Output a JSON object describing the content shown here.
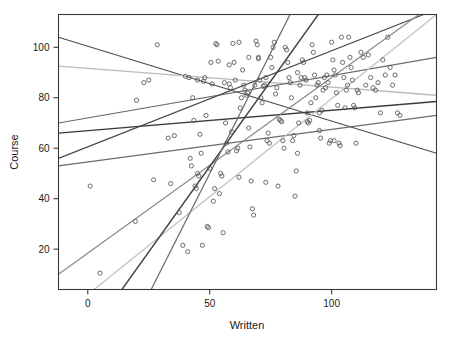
{
  "chart_data": {
    "type": "scatter",
    "title": "",
    "xlabel": "Written",
    "ylabel": "Course",
    "xlim": [
      -12,
      143
    ],
    "ylim": [
      4,
      113
    ],
    "xticks": [
      0,
      50,
      100
    ],
    "yticks": [
      20,
      40,
      60,
      80,
      100
    ],
    "xtick_labels": [
      "0",
      "50",
      "100"
    ],
    "ytick_labels": [
      "20",
      "40",
      "60",
      "80",
      "100"
    ],
    "grid": false,
    "legend": null,
    "marker": "open-circle",
    "points": [
      [
        1,
        45
      ],
      [
        5,
        10.5
      ],
      [
        19.5,
        31
      ],
      [
        20,
        79
      ],
      [
        25,
        87
      ],
      [
        27,
        47.5
      ],
      [
        28.5,
        101
      ],
      [
        34,
        46
      ],
      [
        35.5,
        65
      ],
      [
        37.5,
        34.5
      ],
      [
        39,
        21.5
      ],
      [
        40,
        88.5
      ],
      [
        41,
        19
      ],
      [
        41.5,
        88
      ],
      [
        42,
        56
      ],
      [
        42.5,
        53
      ],
      [
        43,
        80
      ],
      [
        43.5,
        71
      ],
      [
        44,
        45
      ],
      [
        44.5,
        44
      ],
      [
        45,
        50
      ],
      [
        45.5,
        49
      ],
      [
        46,
        65.5
      ],
      [
        46.5,
        58
      ],
      [
        47,
        21.5
      ],
      [
        47.5,
        86.5
      ],
      [
        48,
        88
      ],
      [
        48.5,
        73
      ],
      [
        49,
        29
      ],
      [
        49.5,
        28.5
      ],
      [
        50,
        52
      ],
      [
        50.5,
        94
      ],
      [
        51,
        85.5
      ],
      [
        51.5,
        39
      ],
      [
        52,
        44
      ],
      [
        52.5,
        101.5
      ],
      [
        53,
        101
      ],
      [
        53.5,
        94.5
      ],
      [
        54,
        42
      ],
      [
        54.5,
        50
      ],
      [
        55,
        49
      ],
      [
        55.5,
        26.5
      ],
      [
        56,
        86
      ],
      [
        56.5,
        70
      ],
      [
        57,
        62
      ],
      [
        57.5,
        58.5
      ],
      [
        58,
        85.5
      ],
      [
        58.5,
        84
      ],
      [
        59,
        66.5
      ],
      [
        59.5,
        101.5
      ],
      [
        60,
        94
      ],
      [
        60.5,
        87
      ],
      [
        61,
        59
      ],
      [
        61.5,
        60
      ],
      [
        62,
        48.5
      ],
      [
        62.5,
        76
      ],
      [
        63,
        80
      ],
      [
        63.5,
        91
      ],
      [
        64,
        85
      ],
      [
        64.5,
        83
      ],
      [
        65,
        81
      ],
      [
        65.5,
        82
      ],
      [
        66,
        68
      ],
      [
        66.5,
        60.5
      ],
      [
        67,
        47
      ],
      [
        67.5,
        36
      ],
      [
        68,
        33.5
      ],
      [
        68.5,
        85
      ],
      [
        69,
        102.5
      ],
      [
        69.5,
        101
      ],
      [
        70,
        95.5
      ],
      [
        70.5,
        87
      ],
      [
        71,
        80
      ],
      [
        71.5,
        78
      ],
      [
        72,
        84.5
      ],
      [
        72.5,
        85
      ],
      [
        73,
        46.5
      ],
      [
        73.5,
        63
      ],
      [
        74,
        66
      ],
      [
        74.5,
        62
      ],
      [
        75,
        96
      ],
      [
        75.5,
        92
      ],
      [
        76,
        100
      ],
      [
        76.5,
        102
      ],
      [
        77,
        81.5
      ],
      [
        77.5,
        84
      ],
      [
        78,
        45
      ],
      [
        78.5,
        71.5
      ],
      [
        79,
        71
      ],
      [
        79.5,
        70.5
      ],
      [
        80,
        63
      ],
      [
        80.5,
        60
      ],
      [
        81,
        100
      ],
      [
        81.5,
        99
      ],
      [
        82,
        94
      ],
      [
        82.5,
        88
      ],
      [
        83,
        86
      ],
      [
        83.5,
        80
      ],
      [
        84,
        63
      ],
      [
        84.5,
        65
      ],
      [
        85,
        41
      ],
      [
        85.5,
        51
      ],
      [
        86,
        58
      ],
      [
        86.5,
        70
      ],
      [
        87,
        85
      ],
      [
        87.5,
        88
      ],
      [
        88,
        95
      ],
      [
        88.5,
        94
      ],
      [
        89,
        88
      ],
      [
        89.5,
        87
      ],
      [
        90,
        70.5
      ],
      [
        90.5,
        70
      ],
      [
        91,
        71
      ],
      [
        91.5,
        78
      ],
      [
        92,
        101
      ],
      [
        92.5,
        98
      ],
      [
        93,
        89
      ],
      [
        93.5,
        80
      ],
      [
        94,
        85
      ],
      [
        94.5,
        86
      ],
      [
        95,
        67
      ],
      [
        95.5,
        64
      ],
      [
        96,
        75
      ],
      [
        96.5,
        83
      ],
      [
        97,
        88
      ],
      [
        97.5,
        84
      ],
      [
        98,
        89
      ],
      [
        98.5,
        86
      ],
      [
        99,
        62
      ],
      [
        99.5,
        63
      ],
      [
        100,
        102
      ],
      [
        100.5,
        95
      ],
      [
        101,
        91
      ],
      [
        101.5,
        89
      ],
      [
        102,
        82
      ],
      [
        102.5,
        77
      ],
      [
        103,
        62
      ],
      [
        103.5,
        61
      ],
      [
        104,
        104
      ],
      [
        104.5,
        94
      ],
      [
        105,
        88
      ],
      [
        105.5,
        76
      ],
      [
        106,
        83
      ],
      [
        106.5,
        85
      ],
      [
        107,
        104
      ],
      [
        107.5,
        96
      ],
      [
        108,
        92
      ],
      [
        108.5,
        87
      ],
      [
        109,
        77
      ],
      [
        109.5,
        76
      ],
      [
        110,
        62
      ],
      [
        110.5,
        83
      ],
      [
        111,
        82
      ],
      [
        112,
        98
      ],
      [
        113,
        96
      ],
      [
        114,
        85
      ],
      [
        115,
        97
      ],
      [
        116,
        88
      ],
      [
        117,
        84
      ],
      [
        118,
        83
      ],
      [
        119,
        86
      ],
      [
        120,
        74
      ],
      [
        121,
        95
      ],
      [
        122,
        89
      ],
      [
        123,
        104
      ],
      [
        124,
        92
      ],
      [
        125,
        85
      ],
      [
        126,
        89
      ],
      [
        127,
        74
      ],
      [
        128,
        73
      ],
      [
        62,
        102
      ],
      [
        66,
        96
      ],
      [
        70,
        96
      ],
      [
        73,
        88
      ],
      [
        45,
        87
      ],
      [
        33,
        64
      ],
      [
        23,
        86
      ],
      [
        58,
        93
      ],
      [
        86,
        90
      ],
      [
        90,
        74
      ],
      [
        95,
        74
      ],
      [
        101,
        63
      ]
    ],
    "regression_lines": [
      {
        "name": "line-1",
        "x1": -12,
        "y1": 104,
        "x2": 143,
        "y2": 58,
        "color": "#4d4d4d",
        "width": 1.2
      },
      {
        "name": "line-2",
        "x1": -12,
        "y1": 92.5,
        "x2": 143,
        "y2": 81,
        "color": "#bcbcbc",
        "width": 1.3
      },
      {
        "name": "line-3",
        "x1": -12,
        "y1": 70,
        "x2": 143,
        "y2": 96,
        "color": "#6b6b6b",
        "width": 1.2
      },
      {
        "name": "line-4",
        "x1": -12,
        "y1": 66,
        "x2": 143,
        "y2": 78.5,
        "color": "#3a3a3a",
        "width": 1.4
      },
      {
        "name": "line-5",
        "x1": -12,
        "y1": 56,
        "x2": 143,
        "y2": 115,
        "color": "#4a4a4a",
        "width": 1.3
      },
      {
        "name": "line-6",
        "x1": -12,
        "y1": 53,
        "x2": 143,
        "y2": 73,
        "color": "#6b6b6b",
        "width": 1.3
      },
      {
        "name": "line-7",
        "x1": -12,
        "y1": 10,
        "x2": 143,
        "y2": 118,
        "color": "#8a8a8a",
        "width": 1.2
      },
      {
        "name": "line-8",
        "x1": 0,
        "y1": 2,
        "x2": 143,
        "y2": 113,
        "color": "#c4c4c4",
        "width": 1.4
      },
      {
        "name": "line-9",
        "x1": 14,
        "y1": 4,
        "x2": 96,
        "y2": 115,
        "color": "#3f3f3f",
        "width": 1.3
      },
      {
        "name": "line-10",
        "x1": 26,
        "y1": 4,
        "x2": 84,
        "y2": 115,
        "color": "#6f6f6f",
        "width": 1.3
      }
    ],
    "point_color": "#555555",
    "point_radius_px": 2.1
  },
  "axes": {
    "x_axis_label": "Written",
    "y_axis_label": "Course"
  }
}
